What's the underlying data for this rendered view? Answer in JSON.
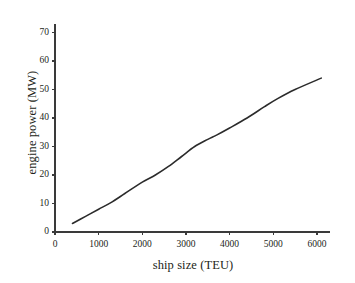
{
  "chart_data": {
    "type": "line",
    "title": "",
    "xlabel": "ship size (TEU)",
    "ylabel": "engine power (MW)",
    "xlim": [
      0,
      6300
    ],
    "ylim": [
      0,
      73
    ],
    "xticks": [
      0,
      1000,
      2000,
      3000,
      4000,
      5000,
      6000
    ],
    "xtick_labels": [
      "0",
      "1000",
      "2000",
      "3000",
      "4000",
      "5000",
      "6000"
    ],
    "yticks": [
      0,
      10,
      20,
      30,
      40,
      50,
      60,
      70
    ],
    "ytick_labels": [
      "0",
      "10",
      "20",
      "30",
      "40",
      "50",
      "60",
      "70"
    ],
    "grid": false,
    "legend": false,
    "line_color": "#2b2b2b",
    "line_width": 1.6,
    "series": [
      {
        "name": "engine power",
        "x": [
          400,
          700,
          1000,
          1300,
          1600,
          2000,
          2300,
          2600,
          2900,
          3200,
          3500,
          3700,
          4000,
          4400,
          4800,
          5100,
          5500,
          6100
        ],
        "values": [
          3.0,
          5.5,
          8.0,
          10.5,
          13.5,
          17.5,
          20.0,
          23.0,
          26.5,
          30.0,
          32.5,
          34.0,
          36.5,
          40.0,
          44.0,
          46.8,
          50.0,
          54.0
        ]
      }
    ]
  },
  "axis": {
    "axis_color": "#3a3a3a",
    "tick_length": 3
  }
}
